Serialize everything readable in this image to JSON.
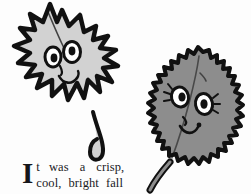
{
  "page": {
    "kind": "storybook-illustration-page",
    "background_color": "#fdfdfd",
    "width": 251,
    "height": 194
  },
  "illustration": {
    "title": "Two smiling cartoon leaves",
    "characters": [
      {
        "id": "maple-leaf",
        "name": "maple-leaf-character",
        "shape": "maple leaf with pointed lobes",
        "fill_color": "#d2d2d2",
        "outline_color": "#111111",
        "expression": "smiling",
        "eyes": 2,
        "has_eyelashes": false,
        "stem_description": "curved stem that bends like a leg and foot"
      },
      {
        "id": "serrated-leaf",
        "name": "serrated-leaf-character",
        "shape": "oval leaf with sawtooth serrated edge",
        "fill_color": "#8d8d8d",
        "outline_color": "#111111",
        "expression": "smiling",
        "eyes": 2,
        "has_eyelashes": true,
        "stem_description": "short stem angled to the lower left"
      }
    ]
  },
  "story": {
    "dropcap": "I",
    "line_1_words": [
      "t",
      "was",
      "a",
      "crisp,"
    ],
    "line_2_words": [
      "cool,",
      "bright",
      "fall"
    ],
    "full_text": "It was a crisp, cool, bright fall",
    "text_color": "#1a1a1d"
  }
}
